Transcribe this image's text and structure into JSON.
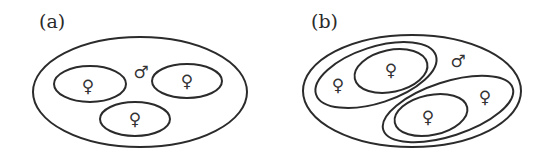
{
  "diagram": {
    "panels": [
      {
        "label": "(a)",
        "male_symbol": "♂",
        "female_symbols": [
          "♀",
          "♀",
          "♀"
        ],
        "description": "One large ellipse containing a male and three separate ellipses each with one female"
      },
      {
        "label": "(b)",
        "male_symbol": "♂",
        "female_symbols": [
          "♀",
          "♀",
          "♀",
          "♀"
        ],
        "description": "One large ellipse containing a male and two nested groups, each with an outer female and an inner ellipse containing a female"
      }
    ],
    "colors": {
      "stroke": "#2b2b2b",
      "background": "#ffffff"
    }
  }
}
